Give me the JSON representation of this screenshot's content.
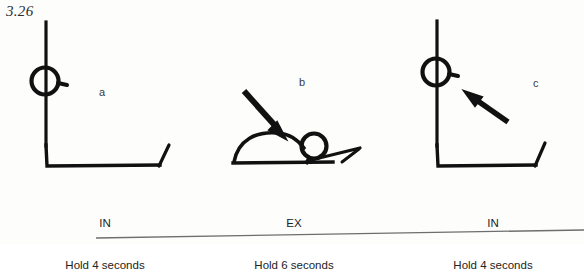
{
  "figure": {
    "number": "3.26",
    "background_color": "#fdfdfc",
    "ink_color": "#111111"
  },
  "panels": [
    {
      "letter": "a",
      "breath": "IN",
      "hold": "Hold 4 seconds",
      "pose": "supine-lying-knees-bent",
      "arrow": "none"
    },
    {
      "letter": "b",
      "breath": "EX",
      "hold": "Hold 6 seconds",
      "pose": "arched-back-prone",
      "arrow": "down-right"
    },
    {
      "letter": "c",
      "breath": "IN",
      "hold": "Hold 4 seconds",
      "pose": "supine-lying-knees-bent",
      "arrow": "up-left"
    }
  ],
  "divider": {
    "name": "page-rule"
  }
}
